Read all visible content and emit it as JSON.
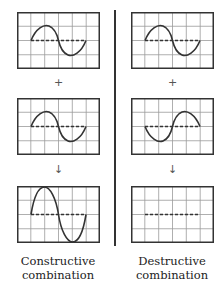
{
  "columns": [
    {
      "id": "constructive",
      "caption_line1": "Constructive",
      "caption_line2": "combination",
      "wave1": "sine-phase-0",
      "operator1": "+",
      "wave2": "sine-phase-0",
      "operator2": "↓",
      "result": "sine-double-amplitude"
    },
    {
      "id": "destructive",
      "caption_line1": "Destructive",
      "caption_line2": "combination",
      "wave1": "sine-phase-0",
      "operator1": "+",
      "wave2": "sine-phase-180",
      "operator2": "↓",
      "result": "flat-line"
    }
  ],
  "grid": {
    "cols": 6,
    "rows": 4
  },
  "colors": {
    "grid": "#9a9a9a",
    "frame": "#333333",
    "wave": "#333333",
    "axis_dash": "#333333"
  }
}
